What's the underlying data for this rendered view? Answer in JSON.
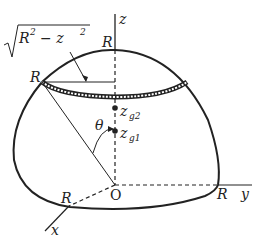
{
  "figure": {
    "labels": {
      "z_axis": "z",
      "y_axis": "y",
      "x_axis": "x",
      "origin": "O",
      "radius_top": "R",
      "radius_left": "R",
      "radius_right": "R",
      "radius_front": "R",
      "ring_radius_expr": "√(R² − z²)",
      "ring_radius_base": "R",
      "ring_radius_minus": "− z",
      "ring_radius_sup": "2",
      "angle": "θ",
      "zg2_main": "z",
      "zg2_sub": "g2",
      "zg1_main": "z",
      "zg1_sub": "g1"
    }
  }
}
